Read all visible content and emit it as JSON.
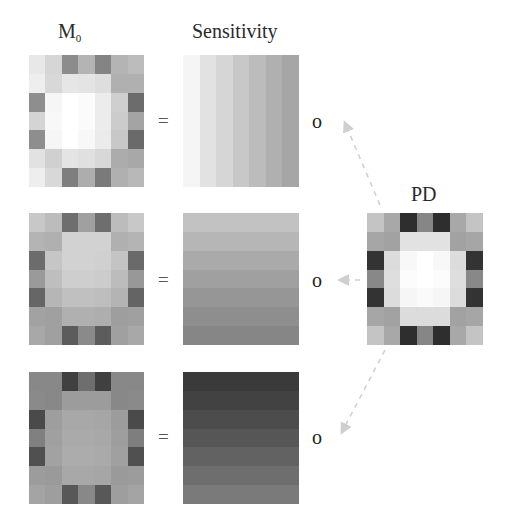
{
  "titles": {
    "m0": "M",
    "m0_sub": "0",
    "sensitivity": "Sensitivity",
    "pd": "PD"
  },
  "operators": {
    "equals": "=",
    "hadamard": "o"
  },
  "colors": {
    "background": "#ffffff",
    "arrow": "#cfcfcf",
    "text": "#2a2a2a"
  },
  "rows": [
    {
      "m0": [
        [
          "#e8e8e8",
          "#d6d6d6",
          "#8c8c8c",
          "#b4b4b4",
          "#848484",
          "#b4b4b4",
          "#bcbcbc"
        ],
        [
          "#eeeeee",
          "#d8d8d8",
          "#e6e6e6",
          "#e4e4e4",
          "#dedede",
          "#b0b0b0",
          "#b0b0b0"
        ],
        [
          "#8e8e8e",
          "#f6f6f6",
          "#ffffff",
          "#fbfbfb",
          "#ececec",
          "#cfcfcf",
          "#6c6c6c"
        ],
        [
          "#d4d4d4",
          "#f8f8f8",
          "#ffffff",
          "#fbfbfb",
          "#ececec",
          "#cccccc",
          "#a4a4a4"
        ],
        [
          "#8e8e8e",
          "#f6f6f6",
          "#ffffff",
          "#f8f8f8",
          "#ebebeb",
          "#c8c8c8",
          "#6a6a6a"
        ],
        [
          "#e2e2e2",
          "#d0d0d0",
          "#e4e4e4",
          "#e0e0e0",
          "#d8d8d8",
          "#acacac",
          "#a8a8a8"
        ],
        [
          "#eeeeee",
          "#d8d8d8",
          "#7e7e7e",
          "#adadad",
          "#7a7a7a",
          "#b0b0b0",
          "#b8b8b8"
        ]
      ],
      "sensitivity_direction": "horizontal",
      "sensitivity": [
        "#f5f5f5",
        "#e2e2e2",
        "#d6d6d6",
        "#c8c8c8",
        "#bcbcbc",
        "#b0b0b0",
        "#a6a6a6"
      ]
    },
    {
      "m0": [
        [
          "#c8c8c8",
          "#bcbcbc",
          "#6e6e6e",
          "#a0a0a0",
          "#6e6e6e",
          "#bcbcbc",
          "#c8c8c8"
        ],
        [
          "#b4b4b4",
          "#b0b0b0",
          "#d2d2d2",
          "#d2d2d2",
          "#d2d2d2",
          "#b0b0b0",
          "#b4b4b4"
        ],
        [
          "#6c6c6c",
          "#c6c6c6",
          "#d2d2d2",
          "#d2d2d2",
          "#d0d0d0",
          "#c4c4c4",
          "#6a6a6a"
        ],
        [
          "#9a9a9a",
          "#bebebe",
          "#cecece",
          "#cecece",
          "#cccccc",
          "#bcbcbc",
          "#989898"
        ],
        [
          "#666666",
          "#b6b6b6",
          "#c0c0c0",
          "#c0c0c0",
          "#bebebe",
          "#b4b4b4",
          "#646464"
        ],
        [
          "#a2a2a2",
          "#a0a0a0",
          "#b0b0b0",
          "#b0b0b0",
          "#aeaeae",
          "#9e9e9e",
          "#a0a0a0"
        ],
        [
          "#a8a8a8",
          "#a0a0a0",
          "#5c5c5c",
          "#8a8a8a",
          "#5c5c5c",
          "#a0a0a0",
          "#a8a8a8"
        ]
      ],
      "sensitivity_direction": "vertical",
      "sensitivity": [
        "#c2c2c2",
        "#b6b6b6",
        "#aaaaaa",
        "#a0a0a0",
        "#969696",
        "#8e8e8e",
        "#868686"
      ]
    },
    {
      "m0": [
        [
          "#888888",
          "#888888",
          "#404040",
          "#6e6e6e",
          "#404040",
          "#888888",
          "#888888"
        ],
        [
          "#8a8a8a",
          "#888888",
          "#9c9c9c",
          "#9c9c9c",
          "#9c9c9c",
          "#888888",
          "#8a8a8a"
        ],
        [
          "#4a4a4a",
          "#9e9e9e",
          "#a8a8a8",
          "#a8a8a8",
          "#a6a6a6",
          "#9c9c9c",
          "#4a4a4a"
        ],
        [
          "#808080",
          "#a0a0a0",
          "#aaaaaa",
          "#aaaaaa",
          "#a8a8a8",
          "#9e9e9e",
          "#7e7e7e"
        ],
        [
          "#505050",
          "#a2a2a2",
          "#acacac",
          "#acacac",
          "#aaaaaa",
          "#a0a0a0",
          "#505050"
        ],
        [
          "#9c9c9c",
          "#9a9a9a",
          "#a8a8a8",
          "#a8a8a8",
          "#a6a6a6",
          "#9a9a9a",
          "#9c9c9c"
        ],
        [
          "#a4a4a4",
          "#9e9e9e",
          "#585858",
          "#888888",
          "#585858",
          "#9e9e9e",
          "#a4a4a4"
        ]
      ],
      "sensitivity_direction": "vertical",
      "sensitivity": [
        "#3a3a3a",
        "#424242",
        "#4c4c4c",
        "#565656",
        "#626262",
        "#6e6e6e",
        "#7a7a7a"
      ]
    }
  ],
  "pd": [
    [
      "#c4c4c4",
      "#a8a8a8",
      "#2e2e2e",
      "#868686",
      "#2e2e2e",
      "#a8a8a8",
      "#c4c4c4"
    ],
    [
      "#a6a6a6",
      "#a2a2a2",
      "#e2e2e2",
      "#e2e2e2",
      "#e2e2e2",
      "#a2a2a2",
      "#a6a6a6"
    ],
    [
      "#333333",
      "#dcdcdc",
      "#f8f8f8",
      "#ffffff",
      "#f8f8f8",
      "#dcdcdc",
      "#333333"
    ],
    [
      "#888888",
      "#dedede",
      "#fcfcfc",
      "#ffffff",
      "#fcfcfc",
      "#dedede",
      "#888888"
    ],
    [
      "#333333",
      "#dcdcdc",
      "#f6f6f6",
      "#fafafa",
      "#f6f6f6",
      "#dcdcdc",
      "#333333"
    ],
    [
      "#a6a6a6",
      "#a2a2a2",
      "#dcdcdc",
      "#dcdcdc",
      "#dcdcdc",
      "#a2a2a2",
      "#a6a6a6"
    ],
    [
      "#c4c4c4",
      "#a8a8a8",
      "#2e2e2e",
      "#868686",
      "#2e2e2e",
      "#a8a8a8",
      "#c4c4c4"
    ]
  ]
}
